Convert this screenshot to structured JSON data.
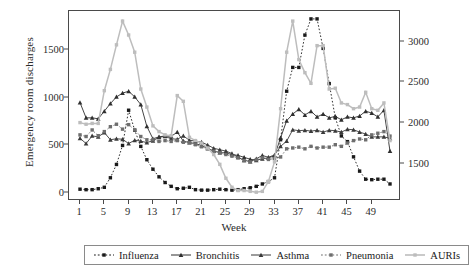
{
  "chart_data": {
    "type": "line",
    "title": "",
    "xlabel": "Week",
    "ylabel": "Emergency room discharges",
    "xlim": [
      1,
      52
    ],
    "ylim": [
      0,
      1850
    ],
    "y2lim": [
      1150,
      3300
    ],
    "xticks": [
      1,
      5,
      9,
      13,
      17,
      21,
      25,
      29,
      33,
      37,
      41,
      45,
      49
    ],
    "yticks": [
      0,
      500,
      1000,
      1500
    ],
    "y2ticks": [
      1500,
      2000,
      2500,
      3000
    ],
    "grid": false,
    "legend_position": "bottom",
    "x": [
      1,
      2,
      3,
      4,
      5,
      6,
      7,
      8,
      9,
      10,
      11,
      12,
      13,
      14,
      15,
      16,
      17,
      18,
      19,
      20,
      21,
      22,
      23,
      24,
      25,
      26,
      27,
      28,
      29,
      30,
      31,
      32,
      33,
      34,
      35,
      36,
      37,
      38,
      39,
      40,
      41,
      42,
      43,
      44,
      45,
      46,
      47,
      48,
      49,
      50,
      51,
      52
    ],
    "series": [
      {
        "name": "Influenza",
        "axis": "left",
        "color": "#1a1a1a",
        "line_style": "dotted",
        "marker": "square",
        "values": [
          40,
          35,
          35,
          45,
          60,
          160,
          300,
          500,
          870,
          660,
          490,
          350,
          250,
          170,
          110,
          70,
          45,
          50,
          60,
          35,
          30,
          30,
          35,
          40,
          35,
          30,
          35,
          45,
          55,
          70,
          95,
          120,
          160,
          560,
          1070,
          1320,
          1320,
          1660,
          1830,
          1830,
          1520,
          1150,
          790,
          600,
          540,
          380,
          230,
          145,
          140,
          145,
          145,
          95
        ]
      },
      {
        "name": "Bronchitis",
        "axis": "left",
        "color": "#2f2f2f",
        "line_style": "solid",
        "marker": "triangle",
        "values": [
          950,
          790,
          790,
          780,
          860,
          940,
          1010,
          1050,
          1070,
          1010,
          930,
          700,
          570,
          590,
          600,
          595,
          640,
          545,
          530,
          520,
          500,
          470,
          440,
          425,
          420,
          405,
          395,
          375,
          355,
          345,
          360,
          370,
          390,
          580,
          760,
          830,
          880,
          820,
          860,
          800,
          830,
          790,
          805,
          770,
          800,
          790,
          810,
          860,
          840,
          800,
          870,
          440
        ]
      },
      {
        "name": "Asthma",
        "axis": "left",
        "color": "#3a3a3a",
        "line_style": "solid",
        "marker": "triangle",
        "values": [
          575,
          520,
          600,
          590,
          635,
          560,
          570,
          565,
          520,
          555,
          545,
          530,
          550,
          585,
          595,
          570,
          565,
          600,
          555,
          545,
          535,
          505,
          470,
          455,
          440,
          415,
          375,
          345,
          330,
          360,
          395,
          375,
          400,
          490,
          545,
          665,
          655,
          660,
          650,
          660,
          640,
          660,
          655,
          640,
          670,
          665,
          640,
          620,
          590,
          590,
          590,
          575
        ]
      },
      {
        "name": "Pneumonia",
        "axis": "right",
        "color": "#6e6e6e",
        "line_style": "dotted",
        "marker": "square",
        "values": [
          1860,
          1840,
          1920,
          1850,
          1900,
          1960,
          1990,
          1930,
          1985,
          1920,
          1840,
          1800,
          1800,
          1780,
          1790,
          1780,
          1790,
          1770,
          1765,
          1740,
          1715,
          1690,
          1660,
          1640,
          1620,
          1600,
          1580,
          1545,
          1530,
          1555,
          1580,
          1560,
          1570,
          1590,
          1690,
          1700,
          1710,
          1690,
          1720,
          1700,
          1710,
          1710,
          1740,
          1720,
          1760,
          1790,
          1810,
          1800,
          1860,
          1880,
          1900,
          1845
        ]
      },
      {
        "name": "AURIs",
        "axis": "right",
        "color": "#bdbdbd",
        "line_style": "solid",
        "marker": "square",
        "values": [
          2010,
          1990,
          2000,
          2000,
          2400,
          2660,
          2960,
          3250,
          3080,
          2870,
          2420,
          2200,
          1970,
          1900,
          1860,
          1850,
          2340,
          2270,
          1830,
          1790,
          1760,
          1700,
          1620,
          1500,
          1330,
          1220,
          1180,
          1180,
          1170,
          1160,
          1170,
          1290,
          1530,
          2180,
          2870,
          3250,
          2780,
          2620,
          2490,
          2950,
          2950,
          2420,
          2430,
          2250,
          2230,
          2180,
          2200,
          2380,
          2180,
          2160,
          2250,
          1790
        ]
      }
    ]
  },
  "axes": {
    "left_ticks": [
      "1500",
      "1000",
      "500",
      "0"
    ],
    "right_ticks": [
      "3000",
      "2500",
      "2000",
      "1500"
    ],
    "x_ticks": [
      "1",
      "5",
      "9",
      "13",
      "17",
      "21",
      "25",
      "29",
      "33",
      "37",
      "41",
      "45",
      "49"
    ],
    "x_title": "Week",
    "y_title": "Emergency room discharges"
  },
  "legend": {
    "items": [
      {
        "label": "Influenza",
        "marker": "square-marker",
        "style": "dotted",
        "color": "#1a1a1a"
      },
      {
        "label": "Bronchitis",
        "marker": "triangle-marker",
        "style": "solid",
        "color": "#2f2f2f"
      },
      {
        "label": "Asthma",
        "marker": "triangle-marker",
        "style": "solid",
        "color": "#3a3a3a"
      },
      {
        "label": "Pneumonia",
        "marker": "square-marker",
        "style": "dotted",
        "color": "#6e6e6e"
      },
      {
        "label": "AURIs",
        "marker": "square-marker",
        "style": "solid",
        "color": "#bdbdbd"
      }
    ]
  },
  "colors": {
    "frame": "#4a4a4a",
    "text": "#2b2b2b",
    "background": "#ffffff"
  }
}
